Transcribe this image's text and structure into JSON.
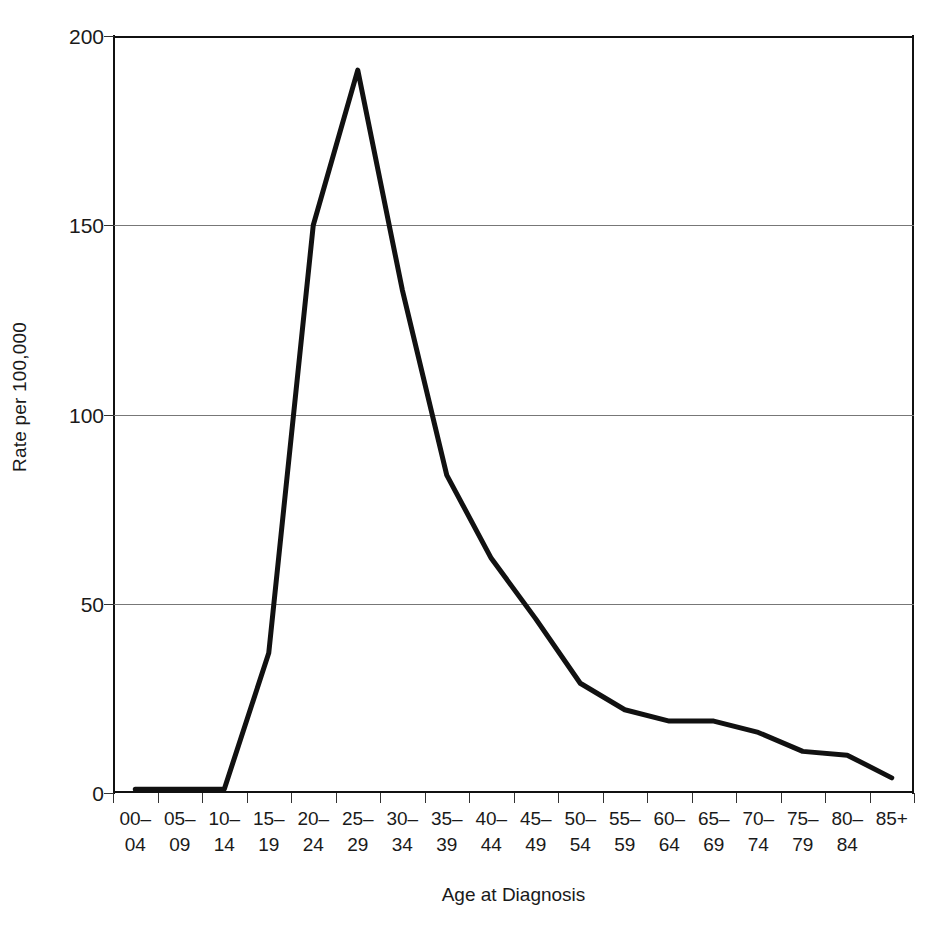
{
  "chart_data": {
    "type": "line",
    "title": "",
    "xlabel": "Age at Diagnosis",
    "ylabel": "Rate per 100,000",
    "ylim": [
      0,
      200
    ],
    "ytick_values": [
      0,
      50,
      100,
      150,
      200
    ],
    "ytick_labels": [
      "0",
      "50",
      "100",
      "150",
      "200"
    ],
    "grid": true,
    "legend": "none",
    "line_color": "#111111",
    "categories": [
      "00–04",
      "05–09",
      "10–14",
      "15–19",
      "20–24",
      "25–29",
      "30–34",
      "35–39",
      "40–44",
      "45–49",
      "50–54",
      "55–59",
      "60–64",
      "65–69",
      "70–74",
      "75–79",
      "80–84",
      "85+"
    ],
    "category_lines": [
      [
        "00–",
        "04"
      ],
      [
        "05–",
        "09"
      ],
      [
        "10–",
        "14"
      ],
      [
        "15–",
        "19"
      ],
      [
        "20–",
        "24"
      ],
      [
        "25–",
        "29"
      ],
      [
        "30–",
        "34"
      ],
      [
        "35–",
        "39"
      ],
      [
        "40–",
        "44"
      ],
      [
        "45–",
        "49"
      ],
      [
        "50–",
        "54"
      ],
      [
        "55–",
        "59"
      ],
      [
        "60–",
        "64"
      ],
      [
        "65–",
        "69"
      ],
      [
        "70–",
        "74"
      ],
      [
        "75–",
        "79"
      ],
      [
        "80–",
        "84"
      ],
      [
        "85+",
        ""
      ]
    ],
    "values": [
      1,
      1,
      1,
      37,
      150,
      191,
      133,
      84,
      62,
      46,
      29,
      22,
      19,
      19,
      16,
      11,
      10,
      4
    ]
  }
}
